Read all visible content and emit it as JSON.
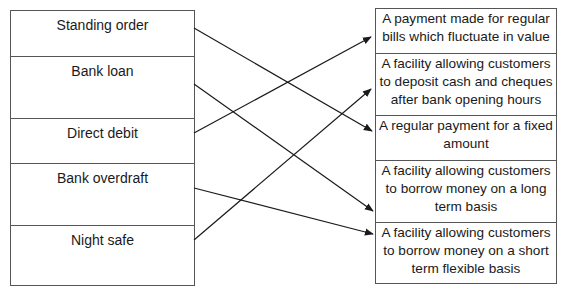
{
  "diagram": {
    "type": "matching",
    "left_terms": [
      {
        "id": "standing_order",
        "label": "Standing order"
      },
      {
        "id": "bank_loan",
        "label": "Bank loan"
      },
      {
        "id": "direct_debit",
        "label": "Direct debit"
      },
      {
        "id": "bank_overdraft",
        "label": "Bank overdraft"
      },
      {
        "id": "night_safe",
        "label": "Night safe"
      }
    ],
    "right_definitions": [
      {
        "id": "def_fluctuate",
        "label": "A payment made for regular bills which fluctuate in value"
      },
      {
        "id": "def_deposit",
        "label": "A facility allowing customers to deposit cash and cheques after bank opening hours"
      },
      {
        "id": "def_fixed",
        "label": "A regular payment for a fixed amount"
      },
      {
        "id": "def_long_term",
        "label": "A facility allowing customers to borrow money on a long term basis"
      },
      {
        "id": "def_short_term",
        "label": "A facility allowing customers to borrow money on a short term flexible basis"
      }
    ],
    "connections": [
      {
        "from": "Standing order",
        "to": "A regular payment for a fixed amount"
      },
      {
        "from": "Bank loan",
        "to": "A facility allowing customers to borrow money on a long term basis"
      },
      {
        "from": "Direct debit",
        "to": "A payment made for regular bills which fluctuate in value"
      },
      {
        "from": "Bank overdraft",
        "to": "A facility allowing customers to borrow money on a short term flexible basis"
      },
      {
        "from": "Night safe",
        "to": "A facility allowing customers to deposit cash and cheques after bank opening hours"
      }
    ],
    "colors": {
      "line": "#1a1a1a",
      "border": "#555555",
      "background": "#ffffff"
    }
  }
}
